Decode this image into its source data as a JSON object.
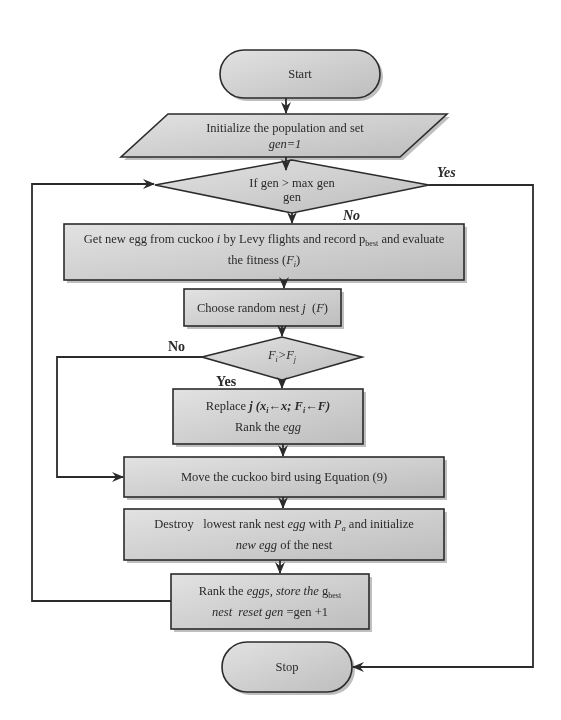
{
  "diagram": {
    "type": "flowchart",
    "colors": {
      "box_fill": "#cfcfcf",
      "stroke": "#2b2b2b",
      "shadow": "#7a7a7a",
      "background": "#ffffff"
    },
    "nodes": {
      "start": {
        "shape": "terminator",
        "text": "Start"
      },
      "init": {
        "shape": "parallelogram",
        "line1": "Initialize the population and set",
        "line2": "gen=1"
      },
      "decision1": {
        "shape": "diamond",
        "line1": "If gen > max gen",
        "line2": "gen"
      },
      "get_egg": {
        "shape": "process",
        "line1_a": "Get new egg from cuckoo ",
        "line1_i": "i",
        "line1_b": " by Levy flights and record p",
        "line1_sub": "best",
        "line1_c": " and evaluate",
        "line2_a": "the fitness (",
        "line2_F": "F",
        "line2_sub": "i",
        "line2_c": ")"
      },
      "choose_nest": {
        "shape": "process",
        "text_a": "Choose random nest ",
        "text_j": "j",
        "text_b": "  (",
        "text_F": "F",
        "text_c": ")"
      },
      "decision2": {
        "shape": "diamond",
        "F1": "F",
        "sub1": "i",
        "op": ">",
        "F2": "F",
        "sub2": "j"
      },
      "replace": {
        "shape": "process",
        "line1_a": "Replace ",
        "line1_j": "j",
        "line1_b": " (x",
        "line1_sub1": "i",
        "line1_c": "←x",
        "line1_d": "; F",
        "line1_sub2": "i",
        "line1_e": "←F)",
        "line2_a": "Rank the ",
        "line2_egg": "egg"
      },
      "move": {
        "shape": "process",
        "text": "Move the cuckoo bird using Equation (9)"
      },
      "destroy": {
        "shape": "process",
        "line1_a": "Destroy   lowest rank nest ",
        "line1_egg": "egg",
        "line1_b": " with ",
        "line1_P": "P",
        "line1_sub": "a",
        "line1_c": " and initialize",
        "line2_new": "new egg",
        "line2_b": " of the nest"
      },
      "rank": {
        "shape": "process",
        "line1_a": "Rank the ",
        "line1_eggs": "eggs, store the",
        "line1_g": " g",
        "line1_sub": "best",
        "line2_nest": "nest  reset gen",
        "line2_b": " =gen +1"
      },
      "stop": {
        "shape": "terminator",
        "text": "Stop"
      }
    },
    "edge_labels": {
      "decision1_yes": "Yes",
      "decision1_no": "No",
      "decision2_no": "No",
      "decision2_yes": "Yes"
    },
    "edges": [
      [
        "start",
        "init"
      ],
      [
        "init",
        "decision1"
      ],
      [
        "decision1",
        "get_egg",
        "No"
      ],
      [
        "decision1",
        "stop",
        "Yes"
      ],
      [
        "get_egg",
        "choose_nest"
      ],
      [
        "choose_nest",
        "decision2"
      ],
      [
        "decision2",
        "replace",
        "Yes"
      ],
      [
        "decision2",
        "move",
        "No"
      ],
      [
        "replace",
        "move"
      ],
      [
        "move",
        "destroy"
      ],
      [
        "destroy",
        "rank"
      ],
      [
        "rank",
        "decision1"
      ]
    ]
  }
}
